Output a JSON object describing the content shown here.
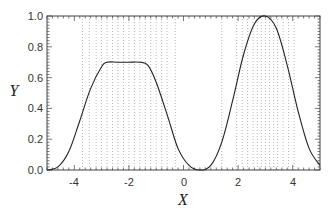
{
  "chart_data": {
    "type": "line",
    "title": "",
    "xlabel": "X",
    "ylabel": "Y",
    "xlim": [
      -5,
      5
    ],
    "ylim": [
      0,
      1.0
    ],
    "x_ticks": [
      -4,
      -2,
      0,
      2,
      4
    ],
    "x_tick_labels": [
      "-4",
      "-2",
      "0",
      "2",
      "4"
    ],
    "y_ticks": [
      0.0,
      0.2,
      0.4,
      0.6,
      0.8,
      1.0
    ],
    "y_tick_labels": [
      "0.0",
      "0.2",
      "0.4",
      "0.6",
      "0.8",
      "1.0"
    ],
    "grid": false,
    "legend": null,
    "series": [
      {
        "name": "curve",
        "color": "#222222",
        "x": [
          -5.0,
          -4.6,
          -4.2,
          -3.8,
          -3.4,
          -3.0,
          -2.8,
          -2.4,
          -2.0,
          -1.6,
          -1.3,
          -1.0,
          -0.6,
          -0.2,
          0.2,
          0.6,
          1.0,
          1.4,
          1.8,
          2.2,
          2.6,
          3.0,
          3.4,
          3.8,
          4.2,
          4.6,
          5.0
        ],
        "y": [
          0.0,
          0.02,
          0.12,
          0.32,
          0.53,
          0.67,
          0.7,
          0.7,
          0.7,
          0.7,
          0.68,
          0.57,
          0.36,
          0.14,
          0.03,
          0.0,
          0.03,
          0.18,
          0.45,
          0.75,
          0.95,
          1.0,
          0.92,
          0.68,
          0.38,
          0.14,
          0.03
        ]
      }
    ],
    "vertical_dotted_lines_x": [
      -3.7,
      -3.45,
      -3.2,
      -3.0,
      -2.8,
      -2.6,
      -2.4,
      -2.2,
      -2.0,
      -1.8,
      -1.6,
      -1.4,
      -1.2,
      -1.0,
      -0.8,
      -0.6,
      -0.3,
      1.4,
      1.95,
      2.15,
      2.35,
      2.55,
      2.7,
      2.85,
      3.0,
      3.15,
      3.3,
      3.45,
      3.65,
      3.85,
      4.05
    ]
  },
  "labels": {
    "xlabel": "X",
    "ylabel": "Y",
    "xticks": [
      "-4",
      "-2",
      "0",
      "2",
      "4"
    ],
    "yticks": [
      "0.0",
      "0.2",
      "0.4",
      "0.6",
      "0.8",
      "1.0"
    ]
  }
}
